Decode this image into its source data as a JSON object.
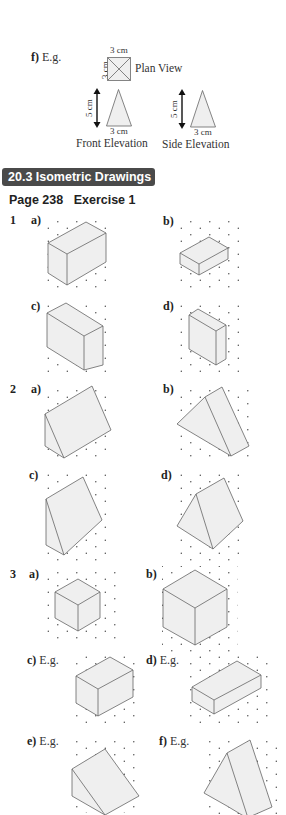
{
  "part_f_top": {
    "label": "f)",
    "eg": "E.g.",
    "plan_view": {
      "caption": "Plan View",
      "top_dim": "3 cm",
      "side_dim": "3 cm"
    },
    "front_elevation": {
      "caption": "Front Elevation",
      "height_dim": "5 cm",
      "base_dim": "3 cm"
    },
    "side_elevation": {
      "caption": "Side Elevation",
      "height_dim": "5 cm",
      "base_dim": "3 cm"
    }
  },
  "section": {
    "title": "20.3  Isometric Drawings",
    "bg_color": "#4a4a4a"
  },
  "page_header": {
    "page": "Page 238",
    "exercise": "Exercise 1"
  },
  "questions": [
    {
      "number": "1",
      "parts": [
        {
          "label": "a)",
          "description": "cuboid 3 x 2 x 2"
        },
        {
          "label": "b)",
          "description": "cuboid 3 x 2 x 1"
        },
        {
          "label": "c)",
          "description": "cuboid 2 x 3 x 3"
        },
        {
          "label": "d)",
          "description": "cuboid 1 x 3 x 3"
        }
      ]
    },
    {
      "number": "2",
      "parts": [
        {
          "label": "a)",
          "description": "triangular prism"
        },
        {
          "label": "b)",
          "description": "triangular prism"
        },
        {
          "label": "c)",
          "description": "triangular prism"
        },
        {
          "label": "d)",
          "description": "triangular prism"
        }
      ]
    },
    {
      "number": "3",
      "parts": [
        {
          "label": "a)",
          "eg": "",
          "description": "cube 2 x 2 x 2"
        },
        {
          "label": "b)",
          "eg": "",
          "description": "cube 3 x 3 x 3"
        },
        {
          "label": "c)",
          "eg": "E.g.",
          "description": "cuboid"
        },
        {
          "label": "d)",
          "eg": "E.g.",
          "description": "cuboid"
        },
        {
          "label": "e)",
          "eg": "E.g.",
          "description": "triangular prism"
        },
        {
          "label": "f)",
          "eg": "E.g.",
          "description": "triangular prism"
        }
      ]
    }
  ]
}
